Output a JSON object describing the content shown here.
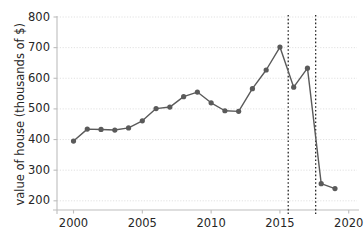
{
  "chart_data": {
    "type": "line",
    "title": "",
    "xlabel": "",
    "ylabel": "value of house (thousands of $)",
    "xlim": [
      1998.8,
      2020.6
    ],
    "ylim": [
      170,
      800
    ],
    "grid": true,
    "legend": "none",
    "marker": "circle",
    "x": [
      2000,
      2001,
      2002,
      2003,
      2004,
      2005,
      2006,
      2007,
      2008,
      2009,
      2010,
      2011,
      2012,
      2013,
      2014,
      2015,
      2016,
      2017,
      2018,
      2019
    ],
    "values": [
      395,
      434,
      433,
      431,
      438,
      461,
      501,
      506,
      540,
      555,
      520,
      494,
      492,
      566,
      627,
      702,
      571,
      633,
      256,
      240
    ],
    "series": [
      {
        "name": "value of house",
        "color": "#5a5a5a",
        "values": [
          395,
          434,
          433,
          431,
          438,
          461,
          501,
          506,
          540,
          555,
          520,
          494,
          492,
          566,
          627,
          702,
          571,
          633,
          256,
          240
        ]
      }
    ],
    "xticks": [
      2000,
      2005,
      2010,
      2015,
      2020
    ],
    "xtick_labels": [
      "2000",
      "2005",
      "2010",
      "2015",
      "2020"
    ],
    "yticks": [
      200,
      300,
      400,
      500,
      600,
      700,
      800
    ],
    "ytick_labels": [
      "200",
      "300",
      "400",
      "500",
      "600",
      "700",
      "800"
    ],
    "annotations": [
      {
        "type": "vline",
        "name": "vertical-dotted-line-1",
        "x": 2015.6,
        "style": "dotted",
        "color": "#000000"
      },
      {
        "type": "vline",
        "name": "vertical-dotted-line-2",
        "x": 2017.6,
        "style": "dotted",
        "color": "#000000"
      }
    ],
    "colors": {
      "line": "#5a5a5a",
      "marker": "#5a5a5a",
      "grid": "#d9d9d9",
      "axis": "#bdbdbd",
      "text": "#262626",
      "background": "#ffffff"
    }
  }
}
